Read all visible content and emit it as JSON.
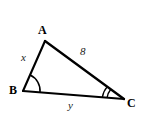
{
  "figure": {
    "type": "triangle-diagram",
    "background_color": "#ffffff",
    "stroke_color": "#000000"
  },
  "vertices": [
    {
      "name": "A",
      "label": "A",
      "x": 45,
      "y": 41
    },
    {
      "name": "B",
      "label": "B",
      "x": 23,
      "y": 91
    },
    {
      "name": "C",
      "label": "C",
      "x": 124,
      "y": 99
    }
  ],
  "sides": [
    {
      "name": "AB",
      "label": "x",
      "kind": "variable"
    },
    {
      "name": "AC",
      "label": "8",
      "kind": "measure"
    },
    {
      "name": "BC",
      "label": "y",
      "kind": "variable"
    }
  ],
  "angle_marks": [
    {
      "vertex": "B",
      "arcs": 1
    },
    {
      "vertex": "C",
      "arcs": 2
    }
  ]
}
